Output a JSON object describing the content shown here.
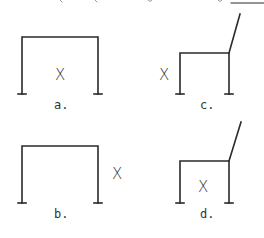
{
  "header": {
    "partial_text": "Points x are given a point of sight, wing",
    "underline_blank": true
  },
  "colors": {
    "stroke": "#2a2a2a",
    "background": "#ffffff"
  },
  "figures": [
    {
      "id": "a",
      "label": "a.",
      "x_mark": "X",
      "shape": "portal-frame",
      "x_position": "inside"
    },
    {
      "id": "b",
      "label": "b.",
      "x_mark": "X",
      "shape": "portal-frame",
      "x_position": "outside-right"
    },
    {
      "id": "c",
      "label": "c.",
      "x_mark": "X",
      "shape": "portal-frame-with-inclined-member",
      "x_position": "outside-left"
    },
    {
      "id": "d",
      "label": "d.",
      "x_mark": "X",
      "shape": "portal-frame-with-inclined-member",
      "x_position": "inside"
    }
  ]
}
